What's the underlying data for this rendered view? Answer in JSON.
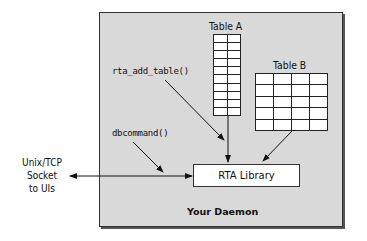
{
  "diagram": {
    "container": {
      "label": "Your Daemon",
      "background": "#d9d9d9",
      "border": "#333333"
    },
    "tables": [
      {
        "id": "table-a",
        "title": "Table A",
        "columns": 2,
        "rows": 10
      },
      {
        "id": "table-b",
        "title": "Table B",
        "columns": 4,
        "rows": 5
      }
    ],
    "functions": {
      "add_table": "rta_add_table()",
      "dbcommand": "dbcommand()"
    },
    "library": {
      "label": "RTA Library"
    },
    "external": {
      "line1": "Unix/TCP",
      "line2": "Socket",
      "line3": "to UIs"
    },
    "edges": [
      {
        "from": "rta_add_table()",
        "to": "RTA Library",
        "type": "arrow"
      },
      {
        "from": "Table A",
        "to": "RTA Library",
        "type": "arrow"
      },
      {
        "from": "Table B",
        "to": "RTA Library",
        "type": "arrow"
      },
      {
        "from": "dbcommand()",
        "to": "socket-line",
        "type": "arrow"
      },
      {
        "from": "Unix/TCP Socket to UIs",
        "to": "RTA Library",
        "type": "bidirectional"
      }
    ]
  }
}
